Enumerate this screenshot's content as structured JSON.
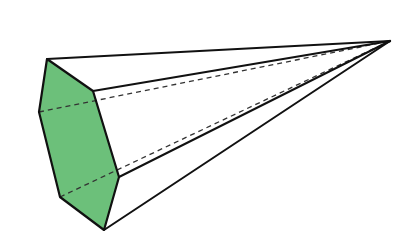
{
  "diagram": {
    "type": "hexagonal-pyramid",
    "colors": {
      "background": "#ffffff",
      "base_fill": "#6cc07a",
      "edge": "#111111",
      "hidden_edge": "#333333"
    },
    "apex": [
      390,
      41
    ],
    "base_vertices": {
      "A_top": [
        47,
        59
      ],
      "B_upper_right": [
        93,
        91
      ],
      "C_lower_right": [
        119,
        177
      ],
      "D_bottom": [
        104,
        230
      ],
      "E_lower_left": [
        60,
        197
      ],
      "F_left": [
        39,
        112
      ]
    },
    "visible_lateral_edges": [
      "A",
      "B",
      "C",
      "D"
    ],
    "hidden_lateral_edges": [
      "F",
      "E"
    ],
    "labels": []
  }
}
